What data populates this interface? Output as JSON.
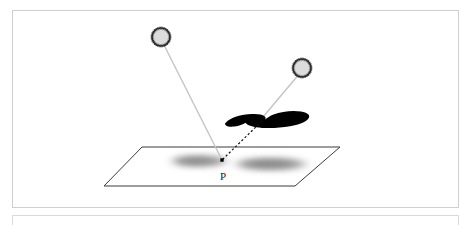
{
  "figure": {
    "title": "",
    "caption": "",
    "background_color": "#ffffff",
    "frame": {
      "name": "figure-border",
      "x": 12,
      "y": 10,
      "width": 447,
      "height": 198,
      "stroke_color": "#cfcfcf",
      "stroke_width": 1
    },
    "secondary_frame": {
      "name": "lower-frame-edge",
      "x": 12,
      "y": 215,
      "width": 447,
      "height": 14,
      "stroke_color": "#d8d8d8",
      "stroke_width": 1
    }
  },
  "labels": [
    {
      "id": "point-p",
      "text": "P",
      "x": 223,
      "y": 180,
      "font_size": 12,
      "color": "#1a1a1a"
    }
  ],
  "lights": [
    {
      "id": "light-source-1",
      "name": "light-source-left",
      "cx": 161,
      "cy": 37,
      "radius": 9.5,
      "fill_color": "#dcdcdc",
      "ring_color": "#2b2b2b",
      "ring_style": "spiky-dotted",
      "spike_count": 30
    },
    {
      "id": "light-source-2",
      "name": "light-source-right",
      "cx": 302,
      "cy": 68,
      "radius": 9.5,
      "fill_color": "#dcdcdc",
      "ring_color": "#2b2b2b",
      "ring_style": "spiky-dotted",
      "spike_count": 30
    }
  ],
  "rays": [
    {
      "id": "ray-1",
      "name": "light-ray-unoccluded",
      "from": "light-source-left",
      "to": "point-p",
      "x1": 164,
      "y1": 46,
      "x2": 222,
      "y2": 160,
      "style": "solid",
      "color": "#c2c2c2",
      "width": 1.3
    },
    {
      "id": "ray-2-upper",
      "name": "light-ray-occluded-upper",
      "from": "light-source-right",
      "to": "occluder",
      "x1": 297,
      "y1": 76,
      "x2": 264,
      "y2": 116,
      "style": "solid",
      "color": "#c2c2c2",
      "width": 1.3
    },
    {
      "id": "ray-2-lower",
      "name": "light-ray-occluded-lower",
      "from": "occluder",
      "to": "point-p",
      "x1": 263,
      "y1": 122,
      "x2": 222,
      "y2": 160,
      "style": "dashed",
      "color": "#111111",
      "width": 1.2,
      "dash_pattern": "2,2"
    }
  ],
  "occluder": {
    "id": "occluder-blob",
    "name": "occluder-shape",
    "fill_color": "#000000",
    "description": "flattened wing-shaped opaque blocker between right light and point P"
  },
  "plane": {
    "id": "ground-plane",
    "name": "ground-plane",
    "points": "142,147 340,147 295,186 104,186",
    "fill_color": "#ffffff",
    "stroke_color": "#3a3a3a",
    "stroke_width": 1
  },
  "shadows": [
    {
      "id": "shadow-left",
      "name": "penumbra-left",
      "cx": 199,
      "cy": 161,
      "rx": 28,
      "ry": 6,
      "color": "#8d8d8d",
      "blur": 5
    },
    {
      "id": "shadow-right",
      "name": "penumbra-right",
      "cx": 271,
      "cy": 164,
      "rx": 36,
      "ry": 6.5,
      "color": "#8d8d8d",
      "blur": 6
    }
  ],
  "surface_point": {
    "id": "point-p-marker",
    "name": "surface-point-marker",
    "cx": 222,
    "cy": 160,
    "size": 3.4,
    "color": "#000000"
  }
}
